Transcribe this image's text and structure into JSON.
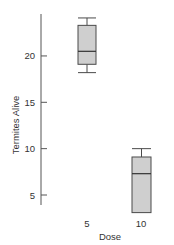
{
  "chart_data": {
    "type": "boxplot",
    "title": "",
    "xlabel": "Dose",
    "ylabel": "Termites Alive",
    "categories": [
      "5",
      "10"
    ],
    "boxes": [
      {
        "category": "5",
        "whisker_low": 18.2,
        "q1": 19.1,
        "median": 20.5,
        "q3": 23.3,
        "whisker_high": 24.1
      },
      {
        "category": "10",
        "whisker_low": 3.1,
        "q1": 3.1,
        "median": 7.3,
        "q3": 9.1,
        "whisker_high": 10.0
      }
    ],
    "yticks": [
      5,
      10,
      15,
      20
    ],
    "ylim": [
      3.9,
      24.5
    ],
    "grid": false,
    "legend": null,
    "colors": {
      "box_fill": "#cfcfcf",
      "box_stroke": "#4a4a4a",
      "axis": "#555555"
    }
  },
  "labels": {
    "ylabel": "Termites Alive",
    "xlabel": "Dose",
    "yticks": [
      "5",
      "10",
      "15",
      "20"
    ],
    "xticks": [
      "5",
      "10"
    ]
  }
}
